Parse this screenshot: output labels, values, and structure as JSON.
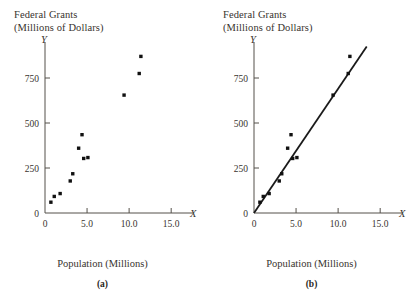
{
  "figure": {
    "y_axis_title_line1": "Federal Grants",
    "y_axis_title_line2": "(Millions of Dollars)",
    "y_axis_letter": "Y",
    "x_axis_letter": "X",
    "x_axis_caption": "Population (Millions)",
    "caption_a": "(a)",
    "caption_b": "(b)",
    "line_color": "#1a1a1a",
    "point_color": "#111111",
    "axis_color": "#55504a"
  },
  "chart_data": [
    {
      "type": "scatter",
      "panel": "(a)",
      "title": "Federal Grants (Millions of Dollars)",
      "xlabel": "Population (Millions)",
      "ylabel": "Federal Grants (Millions of Dollars)",
      "xlim": [
        0,
        17.0
      ],
      "ylim": [
        0,
        950
      ],
      "xticks": [
        0,
        5.0,
        10.0,
        15.0
      ],
      "xticklabels": [
        "0",
        "5.0",
        "10.0",
        "15.0"
      ],
      "yticks": [
        0,
        250,
        500,
        750
      ],
      "yticklabels": [
        "0",
        "250",
        "500",
        "750"
      ],
      "grid": false,
      "legend": false,
      "x": [
        0.7,
        1.1,
        1.8,
        3.0,
        3.3,
        4.0,
        4.4,
        4.6,
        5.1,
        9.4,
        11.2,
        11.4
      ],
      "y": [
        60,
        92,
        108,
        178,
        218,
        360,
        435,
        303,
        308,
        655,
        775,
        870
      ],
      "points": [
        {
          "x": 0.7,
          "y": 60
        },
        {
          "x": 1.1,
          "y": 92
        },
        {
          "x": 1.8,
          "y": 108
        },
        {
          "x": 3.0,
          "y": 178
        },
        {
          "x": 3.3,
          "y": 218
        },
        {
          "x": 4.0,
          "y": 360
        },
        {
          "x": 4.4,
          "y": 435
        },
        {
          "x": 4.6,
          "y": 303
        },
        {
          "x": 5.1,
          "y": 308
        },
        {
          "x": 9.4,
          "y": 655
        },
        {
          "x": 11.2,
          "y": 775
        },
        {
          "x": 11.4,
          "y": 870
        }
      ]
    },
    {
      "type": "scatter",
      "panel": "(b)",
      "title": "Federal Grants (Millions of Dollars)",
      "xlabel": "Population (Millions)",
      "ylabel": "Federal Grants (Millions of Dollars)",
      "xlim": [
        0,
        17.0
      ],
      "ylim": [
        0,
        950
      ],
      "xticks": [
        0,
        5.0,
        10.0,
        15.0
      ],
      "xticklabels": [
        "0",
        "5.0",
        "10.0",
        "15.0"
      ],
      "yticks": [
        0,
        250,
        500,
        750
      ],
      "yticklabels": [
        "0",
        "250",
        "500",
        "750"
      ],
      "grid": false,
      "legend": false,
      "x": [
        0.7,
        1.1,
        1.8,
        3.0,
        3.3,
        4.0,
        4.4,
        4.6,
        5.1,
        9.4,
        11.2,
        11.4
      ],
      "y": [
        60,
        92,
        108,
        178,
        218,
        360,
        435,
        303,
        308,
        655,
        775,
        870
      ],
      "points": [
        {
          "x": 0.7,
          "y": 60
        },
        {
          "x": 1.1,
          "y": 92
        },
        {
          "x": 1.8,
          "y": 108
        },
        {
          "x": 3.0,
          "y": 178
        },
        {
          "x": 3.3,
          "y": 218
        },
        {
          "x": 4.0,
          "y": 360
        },
        {
          "x": 4.4,
          "y": 435
        },
        {
          "x": 4.6,
          "y": 303
        },
        {
          "x": 5.1,
          "y": 308
        },
        {
          "x": 9.4,
          "y": 655
        },
        {
          "x": 11.2,
          "y": 775
        },
        {
          "x": 11.4,
          "y": 870
        }
      ],
      "fit_line": {
        "type": "line",
        "x": [
          0,
          13.4
        ],
        "y": [
          0,
          925
        ],
        "label": "fitted regression line"
      }
    }
  ]
}
